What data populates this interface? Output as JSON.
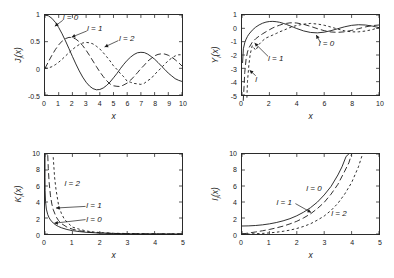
{
  "figure": {
    "background": "#ffffff",
    "axis_color": "#2b2b2b",
    "curve_color": "#1a1a1a"
  },
  "chart_data": [
    {
      "type": "line",
      "panel": "top-left",
      "title": "",
      "xlabel": "x",
      "ylabel": "J_l(x)",
      "ylabel_display": "J",
      "ylabel_sub": "l",
      "ylabel_tail": "(x)",
      "xlim": [
        0,
        10
      ],
      "ylim": [
        -0.5,
        1
      ],
      "grid": false,
      "xticks": [
        0,
        1,
        2,
        3,
        4,
        5,
        6,
        7,
        8,
        9,
        10
      ],
      "xticklabels": [
        "0",
        "1",
        "2",
        "3",
        "4",
        "5",
        "6",
        "7",
        "8",
        "9",
        "10"
      ],
      "yticks": [
        -0.5,
        0,
        0.5,
        1
      ],
      "yticklabels": [
        "-0.5",
        "0",
        "0.5",
        "1"
      ],
      "series": [
        {
          "name": "l = 0",
          "style": "solid",
          "x": [
            0,
            0.25,
            0.5,
            0.75,
            1,
            1.25,
            1.5,
            1.75,
            2,
            2.25,
            2.5,
            2.75,
            3,
            3.25,
            3.5,
            3.75,
            4,
            4.25,
            4.5,
            4.75,
            5,
            5.25,
            5.5,
            5.75,
            6,
            6.25,
            6.5,
            6.75,
            7,
            7.25,
            7.5,
            7.75,
            8,
            8.25,
            8.5,
            8.75,
            9,
            9.25,
            9.5,
            9.75,
            10
          ],
          "y": [
            1,
            0.9844,
            0.9385,
            0.8642,
            0.7652,
            0.6459,
            0.5118,
            0.369,
            0.2239,
            0.0827,
            -0.0484,
            -0.1641,
            -0.2601,
            -0.3325,
            -0.3801,
            -0.4026,
            -0.3971,
            -0.3687,
            -0.3205,
            -0.2566,
            -0.1776,
            -0.0968,
            -0.0068,
            0.0758,
            0.1506,
            0.2113,
            0.2601,
            0.2921,
            0.3001,
            0.2951,
            0.2663,
            0.2211,
            0.1717,
            0.1096,
            0.0419,
            -0.0222,
            -0.0903,
            -0.1421,
            -0.1939,
            -0.2243,
            -0.2459
          ]
        },
        {
          "name": "l = 1",
          "style": "long-dash",
          "x": [
            0,
            0.25,
            0.5,
            0.75,
            1,
            1.25,
            1.5,
            1.75,
            2,
            2.25,
            2.5,
            2.75,
            3,
            3.25,
            3.5,
            3.75,
            4,
            4.25,
            4.5,
            4.75,
            5,
            5.25,
            5.5,
            5.75,
            6,
            6.25,
            6.5,
            6.75,
            7,
            7.25,
            7.5,
            7.75,
            8,
            8.25,
            8.5,
            8.75,
            9,
            9.25,
            9.5,
            9.75,
            10
          ],
          "y": [
            0,
            0.124,
            0.2423,
            0.3492,
            0.4401,
            0.5106,
            0.5579,
            0.5802,
            0.5767,
            0.5484,
            0.4971,
            0.4258,
            0.3391,
            0.2412,
            0.1374,
            0.0336,
            -0.066,
            -0.1538,
            -0.2311,
            -0.2951,
            -0.3276,
            -0.3371,
            -0.3414,
            -0.311,
            -0.2767,
            -0.2209,
            -0.1538,
            -0.0816,
            -0.0047,
            0.06,
            0.1352,
            0.1851,
            0.2346,
            0.2611,
            0.2731,
            0.2673,
            0.2453,
            0.2091,
            0.1613,
            0.1073,
            0.0435
          ]
        },
        {
          "name": "l = 2",
          "style": "short-dash",
          "x": [
            0,
            0.25,
            0.5,
            0.75,
            1,
            1.25,
            1.5,
            1.75,
            2,
            2.25,
            2.5,
            2.75,
            3,
            3.25,
            3.5,
            3.75,
            4,
            4.25,
            4.5,
            4.75,
            5,
            5.25,
            5.5,
            5.75,
            6,
            6.25,
            6.5,
            6.75,
            7,
            7.25,
            7.5,
            7.75,
            8,
            8.25,
            8.5,
            8.75,
            9,
            9.25,
            9.5,
            9.75,
            10
          ],
          "y": [
            0,
            0.0078,
            0.0306,
            0.0673,
            0.1149,
            0.1711,
            0.2321,
            0.294,
            0.3528,
            0.4031,
            0.4461,
            0.4751,
            0.4861,
            0.4791,
            0.4586,
            0.4147,
            0.3641,
            0.294,
            0.2178,
            0.1385,
            0.0466,
            -0.019,
            -0.0968,
            -0.1582,
            -0.2429,
            -0.2617,
            -0.2834,
            -0.29,
            -0.3014,
            -0.28,
            -0.2301,
            -0.1912,
            -0.113,
            -0.0537,
            0.0146,
            0.08,
            0.1448,
            0.193,
            0.233,
            0.2536,
            0.2546
          ]
        }
      ],
      "annotations": [
        {
          "text": "l = 0",
          "x": 1.35,
          "y": 0.92
        },
        {
          "text": "l = 1",
          "x": 3.1,
          "y": 0.72
        },
        {
          "text": "l = 2",
          "x": 5.4,
          "y": 0.54
        }
      ]
    },
    {
      "type": "line",
      "panel": "top-right",
      "title": "",
      "xlabel": "x",
      "ylabel": "Y_l(x)",
      "ylabel_display": "Y",
      "ylabel_sub": "l",
      "ylabel_tail": "(x)",
      "xlim": [
        0,
        10
      ],
      "ylim": [
        -5,
        1
      ],
      "grid": false,
      "xticks": [
        0,
        2,
        4,
        6,
        8,
        10
      ],
      "xticklabels": [
        "0",
        "2",
        "4",
        "6",
        "8",
        "10"
      ],
      "yticks": [
        -5,
        -4,
        -3,
        -2,
        -1,
        0,
        1
      ],
      "yticklabels": [
        "-5",
        "-4",
        "-3",
        "-2",
        "-1",
        "0",
        "1"
      ],
      "series": [
        {
          "name": "l = 0",
          "style": "solid",
          "x": [
            0.04,
            0.1,
            0.2,
            0.3,
            0.4,
            0.5,
            0.75,
            1,
            1.25,
            1.5,
            1.75,
            2,
            2.25,
            2.5,
            2.75,
            3,
            3.25,
            3.5,
            3.75,
            4,
            4.5,
            5,
            5.5,
            6,
            6.5,
            7,
            7.5,
            8,
            8.5,
            9,
            9.5,
            10
          ],
          "y": [
            -2.6,
            -1.5342,
            -1.0811,
            -0.8073,
            -0.606,
            -0.4445,
            -0.1372,
            0.0883,
            0.2582,
            0.3824,
            0.467,
            0.5104,
            0.5208,
            0.4981,
            0.4516,
            0.3769,
            0.2882,
            0.189,
            0.0846,
            -0.0169,
            -0.1947,
            -0.3085,
            -0.3395,
            -0.2882,
            -0.1732,
            -0.0259,
            0.1173,
            0.2235,
            0.2702,
            0.2499,
            0.1712,
            0.0557
          ]
        },
        {
          "name": "l = 1",
          "style": "long-dash",
          "x": [
            0.09,
            0.15,
            0.2,
            0.3,
            0.4,
            0.5,
            0.75,
            1,
            1.25,
            1.5,
            1.75,
            2,
            2.25,
            2.5,
            2.75,
            3,
            3.25,
            3.5,
            3.75,
            4,
            4.5,
            5,
            5.5,
            6,
            6.5,
            7,
            7.5,
            8,
            8.5,
            9,
            9.5,
            10
          ],
          "y": [
            -7.1,
            -4.3648,
            -3.3238,
            -2.2931,
            -1.7809,
            -1.4715,
            -1.0375,
            -0.7812,
            -0.5844,
            -0.4123,
            -0.2575,
            -0.107,
            0.0325,
            0.1459,
            0.2373,
            0.3247,
            0.3707,
            0.4102,
            0.4154,
            0.3979,
            0.301,
            0.1479,
            -0.0238,
            -0.175,
            -0.2741,
            -0.3027,
            -0.2591,
            -0.1581,
            -0.0262,
            0.1043,
            0.2032,
            0.249
          ]
        },
        {
          "name": "l = 2",
          "style": "short-dash",
          "x": [
            0.36,
            0.4,
            0.5,
            0.6,
            0.75,
            1,
            1.25,
            1.5,
            1.75,
            2,
            2.25,
            2.5,
            2.75,
            3,
            3.25,
            3.5,
            3.75,
            4,
            4.5,
            5,
            5.5,
            6,
            6.5,
            7,
            7.5,
            8,
            8.5,
            9,
            9.5,
            10
          ],
          "y": [
            -5.2,
            -4.0,
            -2.7659,
            -1.9284,
            -1.2927,
            -1.6507,
            -1.1931,
            -0.9322,
            -0.7259,
            -0.6174,
            -0.4999,
            -0.3857,
            -0.2603,
            -0.1604,
            -0.0498,
            0.0614,
            0.147,
            0.2159,
            0.3105,
            0.3677,
            0.3227,
            0.2299,
            0.094,
            -0.0582,
            -0.191,
            -0.2633,
            -0.264,
            -0.2026,
            -0.0998,
            0.0557
          ]
        }
      ],
      "annotations": [
        {
          "text": "l = 0",
          "x": 5.6,
          "y": -1.18
        },
        {
          "text": "l = 1",
          "x": 1.95,
          "y": -2.26
        },
        {
          "text": "l",
          "x": 1.02,
          "y": -3.85
        }
      ]
    },
    {
      "type": "line",
      "panel": "bottom-left",
      "title": "",
      "xlabel": "x",
      "ylabel": "K_l(x)",
      "ylabel_display": "K",
      "ylabel_sub": "l",
      "ylabel_tail": "(x)",
      "xlim": [
        0,
        5
      ],
      "ylim": [
        0,
        10
      ],
      "grid": false,
      "xticks": [
        0,
        1,
        2,
        3,
        4,
        5
      ],
      "xticklabels": [
        "0",
        "1",
        "2",
        "3",
        "4",
        "5"
      ],
      "yticks": [
        0,
        2,
        4,
        6,
        8,
        10
      ],
      "yticklabels": [
        "0",
        "2",
        "4",
        "6",
        "8",
        "10"
      ],
      "series": [
        {
          "name": "l = 0",
          "style": "solid",
          "x": [
            5e-05,
            0.0002,
            0.001,
            0.005,
            0.02,
            0.05,
            0.1,
            0.15,
            0.2,
            0.3,
            0.4,
            0.5,
            0.6,
            0.8,
            1,
            1.25,
            1.5,
            1.75,
            2,
            2.5,
            3,
            3.5,
            4,
            4.5,
            5
          ],
          "y": [
            10,
            8.5,
            7.02,
            5.41,
            4.03,
            3.11,
            2.427,
            2.03,
            1.7527,
            1.3725,
            1.1145,
            0.9244,
            0.7775,
            0.5653,
            0.421,
            0.3027,
            0.2138,
            0.1655,
            0.1139,
            0.0623,
            0.0347,
            0.0196,
            0.0112,
            0.0064,
            0.0037
          ]
        },
        {
          "name": "l = 1",
          "style": "long-dash",
          "x": [
            0.1,
            0.12,
            0.15,
            0.2,
            0.25,
            0.3,
            0.4,
            0.5,
            0.6,
            0.8,
            1,
            1.25,
            1.5,
            1.75,
            2,
            2.5,
            3,
            3.5,
            4,
            4.5,
            5
          ],
          "y": [
            9.854,
            8.2,
            6.477,
            4.776,
            3.747,
            3.056,
            2.184,
            1.6564,
            1.3028,
            0.8618,
            0.6019,
            0.4101,
            0.2767,
            0.1971,
            0.1399,
            0.0739,
            0.0402,
            0.0222,
            0.0125,
            0.0071,
            0.004
          ]
        },
        {
          "name": "l = 2",
          "style": "short-dash",
          "x": [
            0.3,
            0.35,
            0.4,
            0.5,
            0.6,
            0.7,
            0.8,
            1,
            1.25,
            1.5,
            1.75,
            2,
            2.5,
            3,
            3.5,
            4,
            4.5,
            5
          ],
          "y": [
            9.6,
            7.1,
            5.6,
            3.5,
            2.56,
            1.89,
            1.5,
            0.8618,
            0.6,
            0.3832,
            0.2618,
            0.1826,
            0.0924,
            0.0615,
            0.0297,
            0.0174,
            0.0097,
            0.0053
          ]
        }
      ],
      "annotations": [
        {
          "text": "l = 2",
          "x": 0.74,
          "y": 6.25
        },
        {
          "text": "l = 1",
          "x": 1.52,
          "y": 3.5
        },
        {
          "text": "l = 0",
          "x": 1.52,
          "y": 1.85
        }
      ]
    },
    {
      "type": "line",
      "panel": "bottom-right",
      "title": "",
      "xlabel": "x",
      "ylabel": "I_l(x)",
      "ylabel_display": "I",
      "ylabel_sub": "l",
      "ylabel_tail": "(x)",
      "xlim": [
        0,
        5
      ],
      "ylim": [
        0,
        10
      ],
      "grid": false,
      "xticks": [
        0,
        1,
        2,
        3,
        4,
        5
      ],
      "xticklabels": [
        "0",
        "1",
        "2",
        "3",
        "4",
        "5"
      ],
      "yticks": [
        0,
        2,
        4,
        6,
        8,
        10
      ],
      "yticklabels": [
        "0",
        "2",
        "4",
        "6",
        "8",
        "10"
      ],
      "series": [
        {
          "name": "l = 0",
          "style": "solid",
          "x": [
            0,
            0.25,
            0.5,
            0.75,
            1,
            1.25,
            1.5,
            1.75,
            2,
            2.25,
            2.5,
            2.75,
            3,
            3.25,
            3.5,
            3.65,
            3.8,
            3.9
          ],
          "y": [
            1,
            1.0157,
            1.0635,
            1.1456,
            1.2661,
            1.4305,
            1.6467,
            1.9141,
            2.2796,
            2.731,
            3.2898,
            3.98,
            4.8808,
            5.9471,
            7.3782,
            8.4,
            9.7,
            10
          ]
        },
        {
          "name": "l = 1",
          "style": "long-dash",
          "x": [
            0,
            0.25,
            0.5,
            0.75,
            1,
            1.25,
            1.5,
            1.75,
            2,
            2.25,
            2.5,
            2.75,
            3,
            3.25,
            3.5,
            3.75,
            3.9,
            4.0
          ],
          "y": [
            0,
            0.126,
            0.2579,
            0.402,
            0.5652,
            0.7627,
            0.9817,
            1.2639,
            1.5906,
            2.0132,
            2.5167,
            3.1745,
            3.9534,
            4.9821,
            6.2058,
            7.8683,
            8.9,
            10
          ]
        },
        {
          "name": "l = 2",
          "style": "short-dash",
          "x": [
            0,
            0.25,
            0.5,
            0.75,
            1,
            1.25,
            1.5,
            1.75,
            2,
            2.25,
            2.5,
            2.75,
            3,
            3.25,
            3.5,
            3.75,
            4,
            4.25,
            4.4
          ],
          "y": [
            0,
            0.0079,
            0.0319,
            0.0738,
            0.1357,
            0.2203,
            0.3378,
            0.4825,
            0.6889,
            0.9498,
            1.2765,
            1.7305,
            2.2452,
            2.95,
            3.832,
            5.0,
            6.4222,
            8.4,
            10
          ]
        }
      ],
      "annotations": [
        {
          "text": "l = 0",
          "x": 2.35,
          "y": 5.55
        },
        {
          "text": "l = 1",
          "x": 1.28,
          "y": 3.95
        },
        {
          "text": "l = 2",
          "x": 3.25,
          "y": 2.55
        }
      ]
    }
  ]
}
